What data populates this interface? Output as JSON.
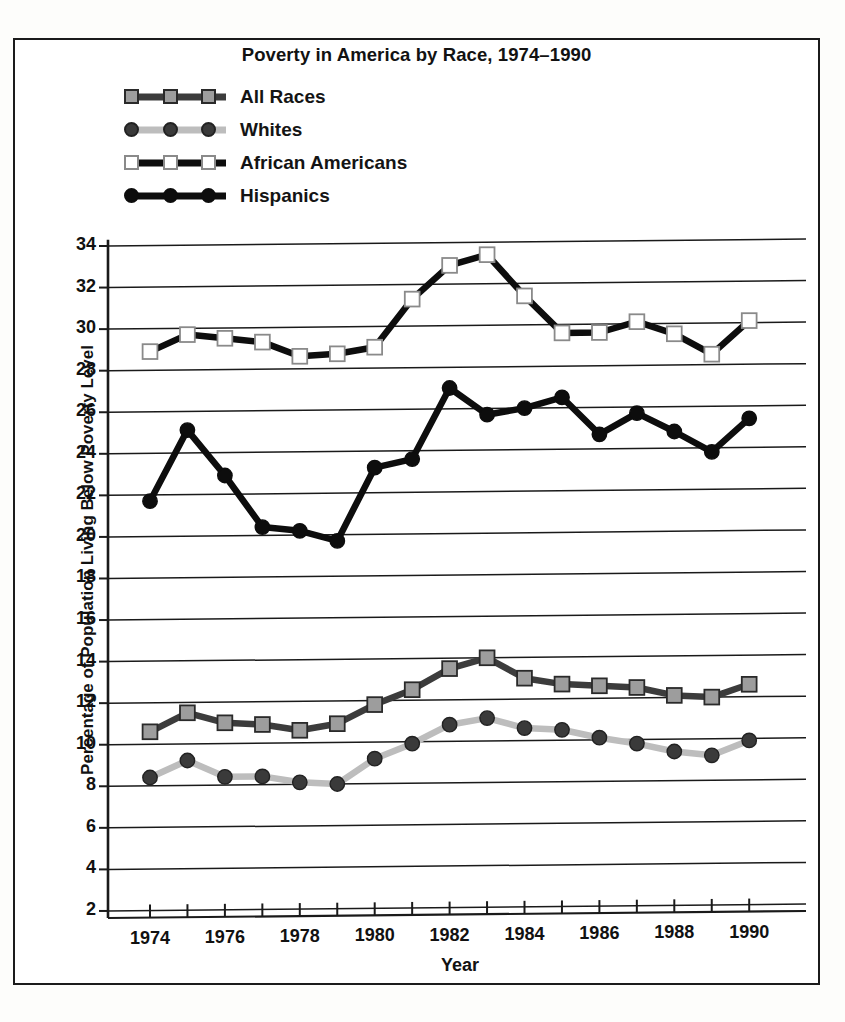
{
  "figure": {
    "title": "Poverty in America by Race, 1974–1990",
    "x_axis_title": "Year",
    "y_axis_title": "Percentage of Population Living Below Poverty Level"
  },
  "legend": {
    "position": "top-left",
    "items": [
      {
        "label": "All Races",
        "marker": "square-gray-filled",
        "line_color": "#3c3c3c",
        "marker_fill": "#9d9d9d",
        "marker_edge": "#2a2a2a",
        "marker_shape": "square"
      },
      {
        "label": "Whites",
        "marker": "circle-dark-filled",
        "line_color": "#bdbdbd",
        "marker_fill": "#3a3a3a",
        "marker_edge": "#222222",
        "marker_shape": "circle"
      },
      {
        "label": "African Americans",
        "marker": "square-white-hollow",
        "line_color": "#0d0d0d",
        "marker_fill": "#ffffff",
        "marker_edge": "#8a8a8a",
        "marker_shape": "square"
      },
      {
        "label": "Hispanics",
        "marker": "circle-black-filled",
        "line_color": "#0d0d0d",
        "marker_fill": "#0d0d0d",
        "marker_edge": "#0d0d0d",
        "marker_shape": "circle"
      }
    ]
  },
  "chart_data": {
    "type": "line",
    "title": "Poverty in America by Race, 1974–1990",
    "xlabel": "Year",
    "ylabel": "Percentage of Population Living Below Poverty Level",
    "grid": "horizontal",
    "legend_position": "top-left",
    "x": [
      1974,
      1975,
      1976,
      1977,
      1978,
      1979,
      1980,
      1981,
      1982,
      1983,
      1984,
      1985,
      1986,
      1987,
      1988,
      1989,
      1990
    ],
    "x_tick_labels": [
      "1974",
      "1976",
      "1978",
      "1980",
      "1982",
      "1984",
      "1986",
      "1988",
      "1990"
    ],
    "x_tick_values": [
      1974,
      1976,
      1978,
      1980,
      1982,
      1984,
      1986,
      1988,
      1990
    ],
    "xlim": [
      1973.2,
      1991.0
    ],
    "y_tick_labels": [
      "2",
      "4",
      "6",
      "8",
      "10",
      "12",
      "14",
      "16",
      "18",
      "20",
      "22",
      "24",
      "26",
      "28",
      "30",
      "32",
      "34"
    ],
    "y_tick_values": [
      2,
      4,
      6,
      8,
      10,
      12,
      14,
      16,
      18,
      20,
      22,
      24,
      26,
      28,
      30,
      32,
      34
    ],
    "ylim": [
      0.6,
      34.6
    ],
    "series": [
      {
        "name": "All Races",
        "values": [
          10.6,
          11.5,
          11.0,
          10.9,
          10.6,
          10.9,
          11.8,
          12.5,
          13.5,
          14.0,
          13.0,
          12.7,
          12.6,
          12.5,
          12.1,
          12.0,
          12.6
        ]
      },
      {
        "name": "Whites",
        "values": [
          8.4,
          9.2,
          8.4,
          8.4,
          8.1,
          8.0,
          9.2,
          9.9,
          10.8,
          11.1,
          10.6,
          10.5,
          10.1,
          9.8,
          9.4,
          9.2,
          9.9
        ]
      },
      {
        "name": "African Americans",
        "values": [
          28.9,
          29.7,
          29.5,
          29.3,
          28.6,
          28.7,
          29.0,
          31.3,
          32.9,
          33.4,
          31.4,
          29.6,
          29.6,
          30.1,
          29.5,
          28.5,
          30.1
        ]
      },
      {
        "name": "Hispanics",
        "values": [
          21.7,
          25.1,
          22.9,
          20.4,
          20.2,
          19.7,
          23.2,
          23.6,
          27.0,
          25.7,
          26.0,
          26.5,
          24.7,
          25.7,
          24.8,
          23.8,
          25.4
        ]
      }
    ]
  }
}
